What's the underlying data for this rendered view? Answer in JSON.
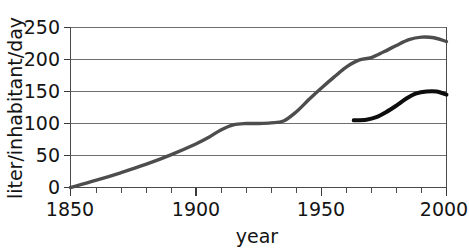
{
  "chart_data": {
    "type": "line",
    "title": "",
    "xlabel": "year",
    "ylabel": "liter/inhabitant/day",
    "xlim": [
      1850,
      2000
    ],
    "ylim": [
      0,
      250
    ],
    "grid": true,
    "legend": "none",
    "x_ticks": [
      1850,
      1900,
      1950,
      2000
    ],
    "x_tick_labels": [
      "1850",
      "1900",
      "1950",
      "2000"
    ],
    "x_minor_tick_step": 10,
    "y_ticks": [
      0,
      50,
      100,
      150,
      200,
      250
    ],
    "y_tick_labels": [
      "0",
      "50",
      "100",
      "150",
      "200",
      "250"
    ],
    "series": [
      {
        "name": "total water use",
        "color": "#4d4d4d",
        "width": 3.4,
        "points": [
          [
            1850,
            0
          ],
          [
            1860,
            11
          ],
          [
            1870,
            23
          ],
          [
            1880,
            36
          ],
          [
            1890,
            51
          ],
          [
            1900,
            68
          ],
          [
            1905,
            78
          ],
          [
            1910,
            90
          ],
          [
            1915,
            98
          ],
          [
            1920,
            100
          ],
          [
            1925,
            100
          ],
          [
            1930,
            101
          ],
          [
            1935,
            104
          ],
          [
            1940,
            118
          ],
          [
            1945,
            137
          ],
          [
            1950,
            155
          ],
          [
            1955,
            172
          ],
          [
            1960,
            188
          ],
          [
            1965,
            199
          ],
          [
            1970,
            203
          ],
          [
            1975,
            212
          ],
          [
            1980,
            222
          ],
          [
            1985,
            231
          ],
          [
            1990,
            235
          ],
          [
            1995,
            234
          ],
          [
            2000,
            228
          ]
        ]
      },
      {
        "name": "household water use",
        "color": "#0d0d0d",
        "width": 4.0,
        "points": [
          [
            1963,
            105
          ],
          [
            1968,
            106
          ],
          [
            1972,
            110
          ],
          [
            1976,
            118
          ],
          [
            1980,
            128
          ],
          [
            1984,
            139
          ],
          [
            1988,
            147
          ],
          [
            1992,
            150
          ],
          [
            1996,
            150
          ],
          [
            2000,
            145
          ]
        ]
      }
    ]
  },
  "axis": {
    "y_label_text": "liter/inhabitant/day",
    "x_label_text": "year"
  }
}
